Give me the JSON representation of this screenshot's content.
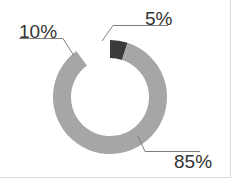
{
  "chart_data": {
    "type": "pie",
    "variant": "donut",
    "title": "",
    "slices": [
      {
        "label": "5%",
        "value": 5,
        "color": "#3a3a3a"
      },
      {
        "label": "85%",
        "value": 85,
        "color": "#a6a6a6"
      },
      {
        "label": "10%",
        "value": 10,
        "color": "#ffffff"
      }
    ],
    "start_angle_deg": 0,
    "legend": "none",
    "data_labels": [
      "5%",
      "85%",
      "10%"
    ]
  },
  "labels": {
    "five": "5%",
    "eightyfive": "85%",
    "ten": "10%"
  }
}
